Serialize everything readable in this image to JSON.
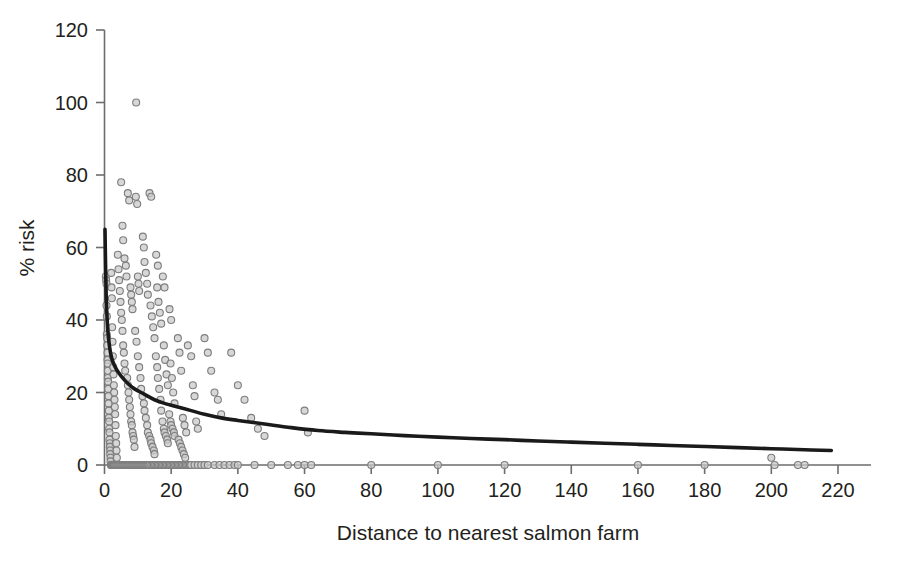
{
  "chart_data": {
    "type": "scatter",
    "title": "",
    "subtitle": "",
    "xlabel": "Distance to nearest salmon farm",
    "ylabel": "% risk",
    "xlim": [
      0,
      228
    ],
    "ylim": [
      0,
      120
    ],
    "xticks": [
      0,
      20,
      40,
      60,
      80,
      100,
      120,
      140,
      160,
      180,
      200,
      220
    ],
    "yticks": [
      0,
      20,
      40,
      60,
      80,
      100,
      120
    ],
    "xtick_labels": [
      "0",
      "20",
      "40",
      "60",
      "80",
      "100",
      "120",
      "140",
      "160",
      "180",
      "200",
      "220"
    ],
    "ytick_labels": [
      "0",
      "20",
      "40",
      "60",
      "80",
      "100",
      "120"
    ],
    "grid": false,
    "legend": null,
    "marker": {
      "shape": "circle-open",
      "fill_color": "#c9c9c9",
      "stroke_color": "#7d7d7d",
      "size_px": 7
    },
    "series": [
      {
        "name": "observations",
        "type": "scatter",
        "points": [
          [
            0.4,
            52
          ],
          [
            0.5,
            51
          ],
          [
            0.6,
            50
          ],
          [
            0.6,
            44
          ],
          [
            0.7,
            41
          ],
          [
            0.7,
            36
          ],
          [
            0.8,
            35
          ],
          [
            0.8,
            33
          ],
          [
            0.9,
            31
          ],
          [
            0.9,
            29
          ],
          [
            1.0,
            28
          ],
          [
            1.0,
            26
          ],
          [
            1.0,
            24
          ],
          [
            1.1,
            23
          ],
          [
            1.1,
            21
          ],
          [
            1.2,
            19
          ],
          [
            1.2,
            17
          ],
          [
            1.3,
            15
          ],
          [
            1.3,
            13
          ],
          [
            1.4,
            12
          ],
          [
            1.4,
            10
          ],
          [
            1.5,
            9
          ],
          [
            1.5,
            7
          ],
          [
            1.6,
            6
          ],
          [
            1.6,
            5
          ],
          [
            1.7,
            4
          ],
          [
            1.7,
            3
          ],
          [
            1.8,
            2
          ],
          [
            1.8,
            1
          ],
          [
            1.9,
            0
          ],
          [
            2.0,
            0
          ],
          [
            2.1,
            0
          ],
          [
            2.2,
            0
          ],
          [
            2.4,
            0
          ],
          [
            2.6,
            0
          ],
          [
            2.8,
            0
          ],
          [
            2.0,
            53
          ],
          [
            2.1,
            49
          ],
          [
            2.2,
            46
          ],
          [
            2.3,
            38
          ],
          [
            2.4,
            34
          ],
          [
            2.5,
            30
          ],
          [
            2.6,
            27
          ],
          [
            2.7,
            25
          ],
          [
            2.8,
            22
          ],
          [
            2.9,
            20
          ],
          [
            3.0,
            18
          ],
          [
            3.1,
            16
          ],
          [
            3.2,
            14
          ],
          [
            3.3,
            11
          ],
          [
            3.4,
            8
          ],
          [
            3.5,
            6
          ],
          [
            3.6,
            4
          ],
          [
            3.7,
            2
          ],
          [
            3.0,
            0
          ],
          [
            3.3,
            0
          ],
          [
            3.6,
            0
          ],
          [
            3.9,
            0
          ],
          [
            4.2,
            0
          ],
          [
            4.5,
            0
          ],
          [
            4.0,
            58
          ],
          [
            4.2,
            54
          ],
          [
            4.4,
            51
          ],
          [
            4.6,
            48
          ],
          [
            4.8,
            45
          ],
          [
            5.0,
            42
          ],
          [
            5.2,
            40
          ],
          [
            5.4,
            37
          ],
          [
            5.6,
            33
          ],
          [
            5.8,
            31
          ],
          [
            6.0,
            28
          ],
          [
            6.2,
            26
          ],
          [
            4.8,
            0
          ],
          [
            5.1,
            0
          ],
          [
            5.4,
            0
          ],
          [
            5.7,
            0
          ],
          [
            6.0,
            0
          ],
          [
            6.3,
            0
          ],
          [
            5.0,
            78
          ],
          [
            5.4,
            66
          ],
          [
            5.6,
            62
          ],
          [
            6.0,
            57
          ],
          [
            6.4,
            55
          ],
          [
            6.6,
            52
          ],
          [
            6.8,
            24
          ],
          [
            7.0,
            22
          ],
          [
            7.2,
            20
          ],
          [
            7.4,
            18
          ],
          [
            7.6,
            16
          ],
          [
            7.8,
            14
          ],
          [
            6.6,
            0
          ],
          [
            6.9,
            0
          ],
          [
            7.2,
            0
          ],
          [
            7.5,
            0
          ],
          [
            7.8,
            0
          ],
          [
            8.1,
            0
          ],
          [
            7.0,
            75
          ],
          [
            7.4,
            73
          ],
          [
            7.8,
            49
          ],
          [
            8.0,
            47
          ],
          [
            8.2,
            45
          ],
          [
            8.4,
            43
          ],
          [
            8.0,
            12
          ],
          [
            8.2,
            11
          ],
          [
            8.4,
            9
          ],
          [
            8.6,
            8
          ],
          [
            8.8,
            7
          ],
          [
            9.0,
            5
          ],
          [
            8.4,
            0
          ],
          [
            8.7,
            0
          ],
          [
            9.0,
            0
          ],
          [
            9.3,
            0
          ],
          [
            9.6,
            0
          ],
          [
            9.9,
            0
          ],
          [
            9.5,
            100
          ],
          [
            9.4,
            74
          ],
          [
            9.8,
            72
          ],
          [
            10.0,
            52
          ],
          [
            10.2,
            50
          ],
          [
            10.4,
            48
          ],
          [
            9.2,
            37
          ],
          [
            9.6,
            34
          ],
          [
            10.0,
            30
          ],
          [
            10.4,
            27
          ],
          [
            10.8,
            24
          ],
          [
            11.0,
            21
          ],
          [
            10.2,
            0
          ],
          [
            10.5,
            0
          ],
          [
            10.8,
            0
          ],
          [
            11.1,
            0
          ],
          [
            11.4,
            0
          ],
          [
            11.7,
            0
          ],
          [
            11.5,
            63
          ],
          [
            11.8,
            60
          ],
          [
            12.0,
            56
          ],
          [
            12.4,
            53
          ],
          [
            12.8,
            50
          ],
          [
            13.0,
            47
          ],
          [
            11.4,
            19
          ],
          [
            11.8,
            17
          ],
          [
            12.0,
            15
          ],
          [
            12.4,
            13
          ],
          [
            12.8,
            11
          ],
          [
            13.0,
            9
          ],
          [
            12.0,
            0
          ],
          [
            12.3,
            0
          ],
          [
            12.6,
            0
          ],
          [
            12.9,
            0
          ],
          [
            13.2,
            0
          ],
          [
            13.5,
            0
          ],
          [
            13.5,
            75
          ],
          [
            14.0,
            74
          ],
          [
            13.8,
            44
          ],
          [
            14.2,
            41
          ],
          [
            14.6,
            38
          ],
          [
            15.0,
            35
          ],
          [
            13.4,
            8
          ],
          [
            13.8,
            7
          ],
          [
            14.0,
            6
          ],
          [
            14.4,
            5
          ],
          [
            14.8,
            4
          ],
          [
            15.0,
            3
          ],
          [
            14.0,
            0
          ],
          [
            14.4,
            0
          ],
          [
            14.8,
            0
          ],
          [
            15.2,
            0
          ],
          [
            15.6,
            0
          ],
          [
            16.0,
            0
          ],
          [
            15.5,
            58
          ],
          [
            16.0,
            55
          ],
          [
            15.8,
            49
          ],
          [
            16.2,
            45
          ],
          [
            16.6,
            42
          ],
          [
            17.0,
            39
          ],
          [
            15.4,
            30
          ],
          [
            15.8,
            27
          ],
          [
            16.0,
            24
          ],
          [
            16.4,
            21
          ],
          [
            16.8,
            18
          ],
          [
            17.0,
            15
          ],
          [
            16.4,
            0
          ],
          [
            16.8,
            0
          ],
          [
            17.2,
            0
          ],
          [
            17.6,
            0
          ],
          [
            18.0,
            0
          ],
          [
            18.4,
            0
          ],
          [
            17.5,
            52
          ],
          [
            18.0,
            49
          ],
          [
            17.8,
            33
          ],
          [
            18.2,
            29
          ],
          [
            18.6,
            25
          ],
          [
            19.0,
            22
          ],
          [
            17.4,
            12
          ],
          [
            17.8,
            10
          ],
          [
            18.0,
            9
          ],
          [
            18.4,
            8
          ],
          [
            18.8,
            7
          ],
          [
            19.0,
            6
          ],
          [
            18.8,
            0
          ],
          [
            19.2,
            0
          ],
          [
            19.6,
            0
          ],
          [
            20.0,
            0
          ],
          [
            20.4,
            0
          ],
          [
            20.8,
            0
          ],
          [
            19.5,
            43
          ],
          [
            20.0,
            40
          ],
          [
            19.8,
            28
          ],
          [
            20.2,
            24
          ],
          [
            20.6,
            20
          ],
          [
            21.0,
            17
          ],
          [
            19.4,
            14
          ],
          [
            19.8,
            12
          ],
          [
            20.0,
            11
          ],
          [
            20.4,
            10
          ],
          [
            20.8,
            9
          ],
          [
            21.0,
            8
          ],
          [
            21.2,
            0
          ],
          [
            21.6,
            0
          ],
          [
            22.0,
            0
          ],
          [
            22.4,
            0
          ],
          [
            22.8,
            0
          ],
          [
            23.2,
            0
          ],
          [
            22.0,
            35
          ],
          [
            22.5,
            31
          ],
          [
            23.0,
            26
          ],
          [
            23.5,
            13
          ],
          [
            24.0,
            11
          ],
          [
            24.5,
            9
          ],
          [
            22.2,
            7
          ],
          [
            22.6,
            6
          ],
          [
            23.0,
            5
          ],
          [
            23.4,
            4
          ],
          [
            23.8,
            3
          ],
          [
            24.2,
            2
          ],
          [
            23.6,
            0
          ],
          [
            24.0,
            0
          ],
          [
            24.4,
            0
          ],
          [
            24.8,
            0
          ],
          [
            25.2,
            0
          ],
          [
            25.6,
            0
          ],
          [
            25.0,
            33
          ],
          [
            26.0,
            30
          ],
          [
            26.5,
            22
          ],
          [
            27.0,
            19
          ],
          [
            27.5,
            12
          ],
          [
            28.0,
            10
          ],
          [
            26.0,
            0
          ],
          [
            27.0,
            0
          ],
          [
            28.0,
            0
          ],
          [
            29.0,
            0
          ],
          [
            30.0,
            0
          ],
          [
            31.0,
            0
          ],
          [
            30.0,
            35
          ],
          [
            31.0,
            31
          ],
          [
            32.0,
            26
          ],
          [
            33.0,
            20
          ],
          [
            34.0,
            18
          ],
          [
            35.0,
            14
          ],
          [
            33.0,
            0
          ],
          [
            34.5,
            0
          ],
          [
            36.0,
            0
          ],
          [
            37.5,
            0
          ],
          [
            39.0,
            0
          ],
          [
            40.0,
            0
          ],
          [
            38.0,
            31
          ],
          [
            40.0,
            22
          ],
          [
            42.0,
            18
          ],
          [
            44.0,
            13
          ],
          [
            46.0,
            10
          ],
          [
            48.0,
            8
          ],
          [
            45.0,
            0
          ],
          [
            50.0,
            0
          ],
          [
            55.0,
            0
          ],
          [
            58.0,
            0
          ],
          [
            60.0,
            0
          ],
          [
            62.0,
            0
          ],
          [
            60.0,
            15
          ],
          [
            61.0,
            9
          ],
          [
            80.0,
            0
          ],
          [
            100.0,
            0
          ],
          [
            120.0,
            0
          ],
          [
            160.0,
            0
          ],
          [
            180.0,
            0
          ],
          [
            200.0,
            2
          ],
          [
            201.0,
            0
          ],
          [
            208.0,
            0
          ],
          [
            210.0,
            0
          ]
        ]
      },
      {
        "name": "fitted-risk-curve",
        "type": "line",
        "color": "#1a1a1a",
        "description": "Monotonic decreasing fit of % risk versus distance",
        "points": [
          [
            0.15,
            65
          ],
          [
            0.3,
            56
          ],
          [
            0.5,
            47
          ],
          [
            0.8,
            40
          ],
          [
            1.2,
            35
          ],
          [
            1.8,
            31
          ],
          [
            2.5,
            28.5
          ],
          [
            3.5,
            26.5
          ],
          [
            5,
            24.5
          ],
          [
            7,
            22.5
          ],
          [
            9,
            21
          ],
          [
            12,
            19.5
          ],
          [
            15,
            18
          ],
          [
            18,
            17
          ],
          [
            22,
            16
          ],
          [
            26,
            15
          ],
          [
            30,
            14
          ],
          [
            35,
            13
          ],
          [
            40,
            12.3
          ],
          [
            48,
            11.3
          ],
          [
            56,
            10.3
          ],
          [
            64,
            9.5
          ],
          [
            72,
            9
          ],
          [
            80,
            8.6
          ],
          [
            90,
            8.1
          ],
          [
            100,
            7.7
          ],
          [
            110,
            7.3
          ],
          [
            120,
            7
          ],
          [
            130,
            6.6
          ],
          [
            140,
            6.3
          ],
          [
            150,
            6
          ],
          [
            160,
            5.7
          ],
          [
            170,
            5.4
          ],
          [
            180,
            5.1
          ],
          [
            190,
            4.8
          ],
          [
            200,
            4.5
          ],
          [
            210,
            4.2
          ],
          [
            218,
            4.0
          ]
        ]
      }
    ]
  },
  "axes": {
    "x_axis_name": "distance-axis",
    "y_axis_name": "risk-axis"
  }
}
